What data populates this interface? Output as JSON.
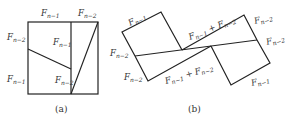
{
  "figure_a": {
    "caption": "(a)",
    "labels": {
      "top_left": {
        "base": "F",
        "sub": "n−1"
      },
      "top_right": {
        "base": "F",
        "sub": "n−2"
      },
      "left_top": {
        "base": "F",
        "sub": "n−2"
      },
      "left_bottom": {
        "base": "F",
        "sub": "n−1"
      },
      "inner_upper": {
        "base": "F",
        "sub": "n−1"
      },
      "inner_lower": {
        "base": "F",
        "sub": "n−2"
      }
    }
  },
  "figure_b": {
    "caption": "(b)",
    "labels": {
      "top_left_edge": {
        "base": "F",
        "sub": "n−1"
      },
      "left_upper": {
        "base": "F",
        "sub": "n−2"
      },
      "left_lower": {
        "base": "F",
        "sub": "n−2"
      },
      "bottom_sum": {
        "base": "F",
        "sub": "n−1",
        "plus": " + ",
        "base2": "F",
        "sub2": "n−2"
      },
      "top_sum": {
        "base": "F",
        "sub": "n−1",
        "plus": " + ",
        "base2": "F",
        "sub2": "n−2"
      },
      "right_upper": {
        "base": "F",
        "sub": "n−2"
      },
      "right_lower": {
        "base": "F",
        "sub": "n−2"
      },
      "bottom_right": {
        "base": "F",
        "sub": "n−1"
      }
    }
  }
}
